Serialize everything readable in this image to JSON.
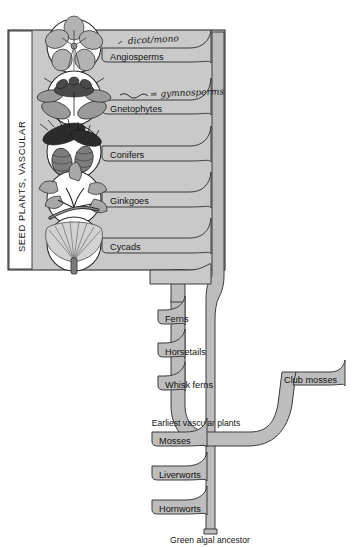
{
  "figure": {
    "colors": {
      "branch_fill": "#bdbdbd",
      "branch_stroke": "#3b3b3b",
      "seed_box_fill": "#c9c9c9",
      "seed_box_stroke": "#2e2e2e",
      "trunk_fill": "#bdbdbd",
      "background": "#ffffff",
      "text": "#121212",
      "handwriting": "#1a1a1a"
    }
  },
  "group_box": {
    "label": "SEED PLANTS, VASCULAR"
  },
  "annotations": [
    {
      "id": "angiosperm-note",
      "text": "dicot/mono"
    },
    {
      "id": "gnetophyte-note",
      "text": "= gymnosperms"
    }
  ],
  "branches": {
    "seed_plants": [
      {
        "id": "angiosperms",
        "label": "Angiosperms",
        "icon": "flower-icon"
      },
      {
        "id": "gnetophytes",
        "label": "Gnetophytes",
        "icon": "gnetophyte-icon"
      },
      {
        "id": "conifers",
        "label": "Conifers",
        "icon": "pinecone-icon"
      },
      {
        "id": "ginkgoes",
        "label": "Ginkgoes",
        "icon": "ginkgo-leaf-icon"
      },
      {
        "id": "cycads",
        "label": "Cycads",
        "icon": "cycad-frond-icon"
      }
    ],
    "seedless_vascular": [
      {
        "id": "ferns",
        "label": "Ferns"
      },
      {
        "id": "horsetails",
        "label": "Horsetails"
      },
      {
        "id": "whisk-ferns",
        "label": "Whisk ferns"
      },
      {
        "id": "club-mosses",
        "label": "Club mosses"
      }
    ],
    "bryophytes": [
      {
        "id": "mosses",
        "label": "Mosses"
      },
      {
        "id": "liverworts",
        "label": "Liverworts"
      },
      {
        "id": "hornworts",
        "label": "Hornworts"
      }
    ]
  },
  "nodes": [
    {
      "id": "earliest-vascular-plants",
      "label": "Earliest vascular plants"
    },
    {
      "id": "green-algal-ancestor",
      "label": "Green algal ancestor"
    }
  ]
}
